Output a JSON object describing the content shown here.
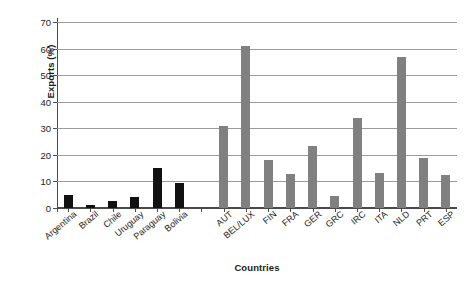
{
  "chart_data": {
    "type": "bar",
    "title": "",
    "xlabel": "Countries",
    "ylabel": "Exports (%)",
    "ylim": [
      0,
      70
    ],
    "ytick_labels": [
      "0",
      "10",
      "20",
      "30",
      "40",
      "50",
      "60",
      "70"
    ],
    "yticks": [
      0,
      10,
      20,
      30,
      40,
      50,
      60,
      70
    ],
    "grid": "horizontal",
    "legend": "none",
    "categories": [
      "Argentina",
      "Brazil",
      "Chile",
      "Uruguay",
      "Paraguay",
      "Bolivia",
      "AUT",
      "BEL/LUX",
      "FIN",
      "FRA",
      "GER",
      "GRC",
      "IRC",
      "ITA",
      "NLD",
      "PRT",
      "ESP"
    ],
    "values": [
      5.0,
      1.3,
      2.8,
      4.2,
      15.2,
      9.6,
      30.7,
      61.0,
      18.0,
      12.7,
      23.4,
      4.5,
      33.8,
      13.0,
      57.0,
      18.7,
      12.5
    ],
    "groups": [
      {
        "name": "Mercosur / Latin America",
        "color": "#111111",
        "categories": [
          "Argentina",
          "Brazil",
          "Chile",
          "Uruguay",
          "Paraguay",
          "Bolivia"
        ],
        "values": [
          5.0,
          1.3,
          2.8,
          4.2,
          15.2,
          9.6
        ]
      },
      {
        "name": "European Union",
        "color": "#808080",
        "categories": [
          "AUT",
          "BEL/LUX",
          "FIN",
          "FRA",
          "GER",
          "GRC",
          "IRC",
          "ITA",
          "NLD",
          "PRT",
          "ESP"
        ],
        "values": [
          30.7,
          61.0,
          18.0,
          12.7,
          23.4,
          4.5,
          33.8,
          13.0,
          57.0,
          18.7,
          12.5
        ]
      }
    ],
    "bar_colors": [
      "#111111",
      "#111111",
      "#111111",
      "#111111",
      "#111111",
      "#111111",
      "#808080",
      "#808080",
      "#808080",
      "#808080",
      "#808080",
      "#808080",
      "#808080",
      "#808080",
      "#808080",
      "#808080",
      "#808080"
    ],
    "gap_after_index": 5
  },
  "style": {
    "gridline_color": "#9b9b9b",
    "axis_color": "#4a4a4a",
    "background": "#ffffff",
    "text_color": "#1b1b1b"
  }
}
